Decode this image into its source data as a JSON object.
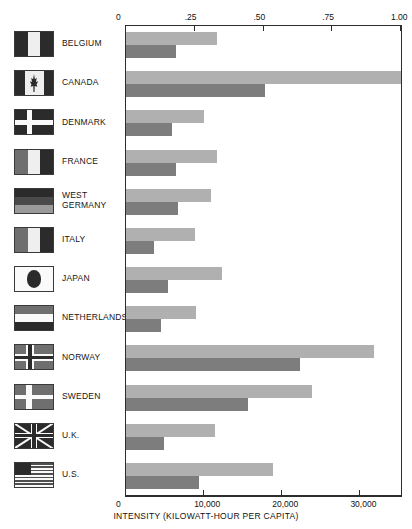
{
  "chart_data": {
    "type": "bar",
    "title": "",
    "orientation": "horizontal",
    "grid": false,
    "legend_position": "none",
    "categories": [
      "BELGIUM",
      "CANADA",
      "DENMARK",
      "FRANCE",
      "WEST\nGERMANY",
      "ITALY",
      "JAPAN",
      "NETHERLANDS",
      "NORWAY",
      "SWEDEN",
      "U.K.",
      "U.S."
    ],
    "series": [
      {
        "name": "Electricity share (fraction)",
        "axis": "top",
        "values": [
          0.33,
          1.0,
          0.285,
          0.33,
          0.31,
          0.25,
          0.35,
          0.255,
          0.9,
          0.675,
          0.325,
          0.535
        ]
      },
      {
        "name": "Intensity (kilowatt-hour per capita)",
        "axis": "bottom",
        "values": [
          6400,
          17800,
          5900,
          6400,
          6700,
          3600,
          5400,
          4500,
          22300,
          15600,
          4900,
          9300
        ]
      }
    ],
    "top_axis": {
      "ticks": [
        0,
        0.25,
        0.5,
        0.75,
        1.0
      ],
      "tick_labels": [
        "0",
        ".25",
        ".50",
        ".75",
        "1.00"
      ],
      "range": [
        0,
        1.0
      ],
      "label": ""
    },
    "bottom_axis": {
      "ticks": [
        0,
        10000,
        20000,
        30000
      ],
      "tick_labels": [
        "0",
        "10,000",
        "20,000",
        "30,000"
      ],
      "range": [
        0,
        35200
      ],
      "label": "INTENSITY (KILOWATT-HOUR PER CAPITA)"
    },
    "colors": {
      "light_bar": "#b0b0b0",
      "dark_bar": "#7d7d7d",
      "axis": "#2d2d2d",
      "background": "#ffffff"
    }
  },
  "flags": [
    {
      "name": "belgium-flag"
    },
    {
      "name": "canada-flag"
    },
    {
      "name": "denmark-flag"
    },
    {
      "name": "france-flag"
    },
    {
      "name": "west-germany-flag"
    },
    {
      "name": "italy-flag"
    },
    {
      "name": "japan-flag"
    },
    {
      "name": "netherlands-flag"
    },
    {
      "name": "norway-flag"
    },
    {
      "name": "sweden-flag"
    },
    {
      "name": "uk-flag"
    },
    {
      "name": "us-flag"
    }
  ]
}
